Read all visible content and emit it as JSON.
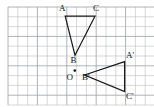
{
  "figure": {
    "background_color": "#ffffff",
    "stroke_color": "#1a1a1a",
    "grid": {
      "color": "#b9bcc0",
      "major_color": "#9b9fa4",
      "cell_size": 9.8,
      "origin_x": 8,
      "origin_y": 7,
      "columns": 15,
      "rows": 10,
      "visible": true
    },
    "shapes": [
      {
        "name": "triangle-abc",
        "type": "polygon",
        "points": [
          [
            65.2,
            16.2
          ],
          [
            75.0,
            55.3
          ],
          [
            95.0,
            16.2
          ]
        ],
        "vertex_labels": [
          "A",
          "B",
          "C"
        ]
      },
      {
        "name": "triangle-a-prime-b-prime-c-prime",
        "type": "polygon",
        "points": [
          [
            124.6,
            61.6
          ],
          [
            84.6,
            75.0
          ],
          [
            124.6,
            91.5
          ]
        ],
        "vertex_labels": [
          "A'",
          "B'",
          "C'"
        ]
      }
    ],
    "center_point": {
      "name": "rotation-center-o",
      "label": "O",
      "x": 74.8,
      "y": 70.6,
      "radius": 1.3
    },
    "labels": [
      {
        "name": "label-a",
        "text": "A",
        "x": 59.0,
        "y": 4.0
      },
      {
        "name": "label-c",
        "text": "C",
        "x": 93.0,
        "y": 4.0
      },
      {
        "name": "label-b",
        "text": "B",
        "x": 70.5,
        "y": 56.0
      },
      {
        "name": "label-o",
        "text": "O",
        "x": 66.5,
        "y": 72.5
      },
      {
        "name": "label-bp",
        "text": "B'",
        "x": 82.0,
        "y": 72.5
      },
      {
        "name": "label-ap",
        "text": "A'",
        "x": 126.0,
        "y": 51.0
      },
      {
        "name": "label-cp",
        "text": "C'",
        "x": 126.0,
        "y": 92.0
      }
    ]
  }
}
